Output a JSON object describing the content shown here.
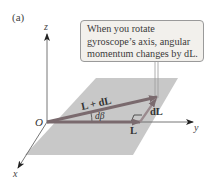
{
  "figure": {
    "panel_label": "(a)",
    "axes": {
      "x": "x",
      "y": "y",
      "z": "z",
      "origin": "O"
    },
    "vectors": {
      "L": "L",
      "L_plus_dL": "L + dL",
      "dL": "dL",
      "angle": "dβ"
    },
    "callout": {
      "lines": [
        "When you rotate",
        "gyroscope’s axis, angular",
        "momentum changes by dL."
      ]
    },
    "colors": {
      "plane": "#c8c8c8",
      "vector": "#7a6a6e",
      "axis": "#555555",
      "callout_bg": "#f2f0ec"
    }
  }
}
